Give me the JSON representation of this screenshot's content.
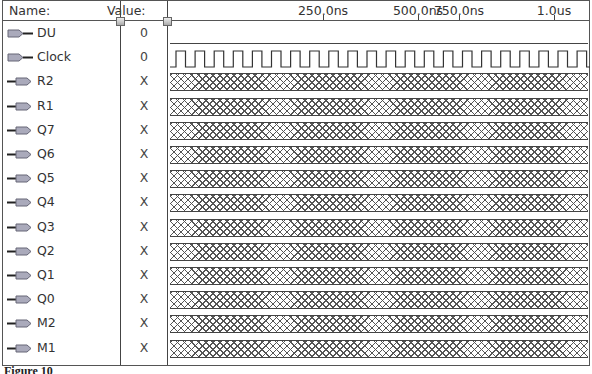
{
  "header": {
    "name_label": "Name:",
    "value_label": "Value:"
  },
  "timeline": {
    "ticks": [
      {
        "label": "250.0ns",
        "x": 322
      },
      {
        "label": "500.0ns",
        "x": 470
      },
      {
        "label": "750.0ns",
        "x": 458
      },
      {
        "label": "1.0us",
        "x": 553
      }
    ]
  },
  "signals": [
    {
      "name": "DU",
      "value": "0",
      "type": "input",
      "wave": "low"
    },
    {
      "name": "Clock",
      "value": "0",
      "type": "input",
      "wave": "clock"
    },
    {
      "name": "R2",
      "value": "X",
      "type": "output",
      "wave": "unknown"
    },
    {
      "name": "R1",
      "value": "X",
      "type": "output",
      "wave": "unknown"
    },
    {
      "name": "Q7",
      "value": "X",
      "type": "output",
      "wave": "unknown"
    },
    {
      "name": "Q6",
      "value": "X",
      "type": "output",
      "wave": "unknown"
    },
    {
      "name": "Q5",
      "value": "X",
      "type": "output",
      "wave": "unknown"
    },
    {
      "name": "Q4",
      "value": "X",
      "type": "output",
      "wave": "unknown"
    },
    {
      "name": "Q3",
      "value": "X",
      "type": "output",
      "wave": "unknown"
    },
    {
      "name": "Q2",
      "value": "X",
      "type": "output",
      "wave": "unknown"
    },
    {
      "name": "Q1",
      "value": "X",
      "type": "output",
      "wave": "unknown"
    },
    {
      "name": "Q0",
      "value": "X",
      "type": "output",
      "wave": "unknown"
    },
    {
      "name": "M2",
      "value": "X",
      "type": "output",
      "wave": "unknown"
    },
    {
      "name": "M1",
      "value": "X",
      "type": "output",
      "wave": "unknown"
    }
  ],
  "caption": "Figure 10"
}
